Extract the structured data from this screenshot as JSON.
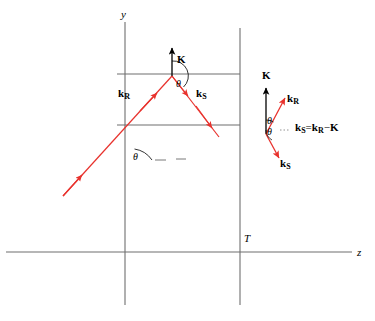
{
  "figure": {
    "colors": {
      "ray": "#e8322d",
      "axis": "#6f6f6f",
      "layer_line": "#6f6f6f",
      "vector_black": "#000000",
      "background": "#ffffff"
    },
    "axes": {
      "y_label": "y",
      "z_label": "z",
      "thickness_label": "T"
    },
    "main_diagram": {
      "incident_vector_label": "k",
      "incident_vector_subscript": "R",
      "scattered_vector_label": "k",
      "scattered_vector_subscript": "S",
      "grating_vector_label": "K",
      "angle_label_vertex": "θ",
      "angle_label_axis": "θ"
    },
    "vector_triangle": {
      "grating_vector_label": "K",
      "reference_vector_label": "k",
      "reference_vector_subscript": "R",
      "signal_vector_label": "k",
      "signal_vector_subscript": "S",
      "angle_upper": "θ",
      "angle_lower": "θ",
      "equation": {
        "lhs_symbol": "k",
        "lhs_sub": "S",
        "equals": "=",
        "rhs_symbol": "k",
        "rhs_sub": "R",
        "minus": "−",
        "rhs_term": "K"
      }
    }
  }
}
